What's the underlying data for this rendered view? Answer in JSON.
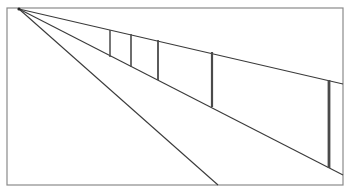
{
  "diagram": {
    "type": "one-point-perspective-fence",
    "frame": {
      "x": 7,
      "y": 8,
      "width": 336,
      "height": 177,
      "stroke": "#8a8a8a"
    },
    "vanishing_point": {
      "x": 19,
      "y": 9
    },
    "lines": [
      {
        "name": "top-rail",
        "x2": 343,
        "y2": 84
      },
      {
        "name": "bottom-rail",
        "x2": 343,
        "y2": 175
      },
      {
        "name": "ground-line",
        "x2": 218,
        "y2": 185
      }
    ],
    "posts": [
      {
        "x": 110,
        "y1": 30,
        "y2": 57,
        "width": 1.5
      },
      {
        "x": 131,
        "y1": 34,
        "y2": 67,
        "width": 1.6
      },
      {
        "x": 158,
        "y1": 40,
        "y2": 80,
        "width": 1.8
      },
      {
        "x": 212,
        "y1": 52,
        "y2": 107,
        "width": 2.2
      },
      {
        "x": 329,
        "y1": 80,
        "y2": 168,
        "width": 2.8
      }
    ],
    "line_color": "#3a3a3a",
    "post_color": "#4a4a4a"
  }
}
